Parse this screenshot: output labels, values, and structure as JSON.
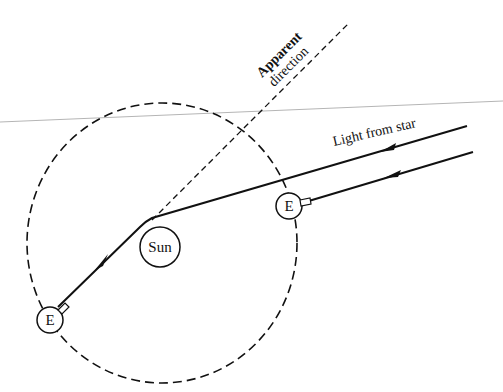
{
  "diagram": {
    "type": "gravitational-light-deflection",
    "labels": {
      "apparent_direction_line1": "Apparent",
      "apparent_direction_line2": "direction",
      "light_from_star": "Light from star",
      "sun": "Sun",
      "earth_right": "E",
      "earth_left": "E"
    },
    "colors": {
      "ink": "#111111",
      "guide_line": "#b5b5b5",
      "background": "#ffffff"
    },
    "elements": {
      "orbit": {
        "style": "dashed",
        "cx": 162,
        "cy": 243,
        "rx": 135,
        "ry": 140
      },
      "sun": {
        "cx": 160,
        "cy": 247,
        "r": 20
      },
      "earth_right": {
        "cx": 289,
        "cy": 206,
        "r": 13
      },
      "earth_left": {
        "cx": 50,
        "cy": 320,
        "r": 13
      },
      "deflected_ray": {
        "from": [
          467,
          126
        ],
        "bend": [
          152,
          220
        ],
        "to": [
          58,
          308
        ]
      },
      "parallel_ray": {
        "from": [
          473,
          152
        ],
        "to": [
          302,
          203
        ]
      },
      "apparent_direction_line": {
        "style": "dashed",
        "from": [
          152,
          220
        ],
        "to": [
          348,
          24
        ]
      }
    }
  }
}
